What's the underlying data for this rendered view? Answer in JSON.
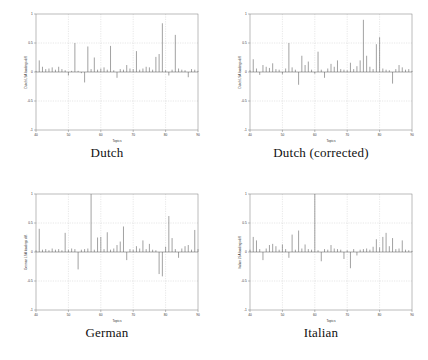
{
  "figure": {
    "background": "#ffffff",
    "panel_background": "#ffffff",
    "axis_color": "#7a7a7a",
    "grid_color": "#b9b9b9",
    "stem_color": "#555555",
    "layout": "2x2"
  },
  "panels": [
    {
      "caption": "Dutch",
      "xlabel": "Topics",
      "ylabel": "Dutch LSA loadings diff.",
      "xticks": [
        "40",
        "50",
        "60",
        "70",
        "80",
        "90"
      ],
      "yticks": [
        "1",
        "0.5",
        "0",
        "-0.5",
        "-1"
      ]
    },
    {
      "caption": "Dutch (corrected)",
      "xlabel": "Topics",
      "ylabel": "Dutch LSA loadings diff.",
      "xticks": [
        "40",
        "50",
        "60",
        "70",
        "80",
        "90"
      ],
      "yticks": [
        "1",
        "0.5",
        "0",
        "-0.5",
        "-1"
      ]
    },
    {
      "caption": "German",
      "xlabel": "Topics",
      "ylabel": "German LSA loadings diff.",
      "xticks": [
        "40",
        "50",
        "60",
        "70",
        "80",
        "90"
      ],
      "yticks": [
        "1",
        "0.5",
        "0",
        "-0.5",
        "-1"
      ]
    },
    {
      "caption": "Italian",
      "xlabel": "Topics",
      "ylabel": "Italian LSA loadings diff.",
      "xticks": [
        "40",
        "50",
        "60",
        "70",
        "80",
        "90"
      ],
      "yticks": [
        "1",
        "0.5",
        "0",
        "-0.5",
        "-1"
      ]
    }
  ],
  "chart_data": [
    {
      "type": "bar",
      "title": "Dutch",
      "xlabel": "Topics",
      "ylabel": "Dutch LSA loadings diff.",
      "xlim": [
        40,
        90
      ],
      "ylim": [
        -1,
        1
      ],
      "xticks": [
        40,
        50,
        60,
        70,
        80,
        90
      ],
      "yticks": [
        -1,
        -0.5,
        0,
        0.5,
        1
      ],
      "grid": true,
      "legend": "none",
      "x": [
        40,
        41,
        42,
        43,
        44,
        45,
        46,
        47,
        48,
        49,
        50,
        51,
        52,
        53,
        54,
        55,
        56,
        57,
        58,
        59,
        60,
        61,
        62,
        63,
        64,
        65,
        66,
        67,
        68,
        69,
        70,
        71,
        72,
        73,
        74,
        75,
        76,
        77,
        78,
        79,
        80,
        81,
        82,
        83,
        84,
        85,
        86,
        87,
        88,
        89,
        90
      ],
      "values": [
        0.02,
        0.2,
        0.09,
        0.05,
        0.06,
        0.08,
        0.04,
        0.09,
        0.05,
        0.03,
        -0.06,
        0.02,
        0.5,
        0.02,
        -0.02,
        -0.18,
        0.44,
        0.05,
        0.25,
        0.04,
        0.06,
        0.08,
        0.04,
        0.45,
        0.03,
        -0.1,
        0.05,
        0.04,
        0.12,
        0.06,
        0.05,
        0.36,
        0.04,
        0.06,
        0.09,
        0.08,
        0.04,
        0.26,
        0.31,
        0.84,
        0.03,
        -0.06,
        0.04,
        0.64,
        0.06,
        0.04,
        0.03,
        -0.09,
        0.05,
        0.04,
        0.02
      ]
    },
    {
      "type": "bar",
      "title": "Dutch (corrected)",
      "xlabel": "Topics",
      "ylabel": "Dutch LSA loadings diff.",
      "xlim": [
        40,
        90
      ],
      "ylim": [
        -1,
        1
      ],
      "xticks": [
        40,
        50,
        60,
        70,
        80,
        90
      ],
      "yticks": [
        -1,
        -0.5,
        0,
        0.5,
        1
      ],
      "grid": true,
      "legend": "none",
      "x": [
        40,
        41,
        42,
        43,
        44,
        45,
        46,
        47,
        48,
        49,
        50,
        51,
        52,
        53,
        54,
        55,
        56,
        57,
        58,
        59,
        60,
        61,
        62,
        63,
        64,
        65,
        66,
        67,
        68,
        69,
        70,
        71,
        72,
        73,
        74,
        75,
        76,
        77,
        78,
        79,
        80,
        81,
        82,
        83,
        84,
        85,
        86,
        87,
        88,
        89,
        90
      ],
      "values": [
        0.03,
        0.22,
        0.06,
        -0.05,
        0.12,
        0.09,
        0.07,
        0.15,
        0.05,
        0.04,
        -0.04,
        0.06,
        0.5,
        0.08,
        0.04,
        -0.22,
        0.28,
        0.12,
        0.18,
        0.04,
        -0.03,
        0.35,
        0.04,
        -0.1,
        0.06,
        0.14,
        0.09,
        0.2,
        0.05,
        0.04,
        0.03,
        0.16,
        0.05,
        0.1,
        0.2,
        0.9,
        0.28,
        0.09,
        0.05,
        0.48,
        0.6,
        0.06,
        0.04,
        0.03,
        -0.2,
        0.05,
        0.12,
        0.08,
        0.04,
        0.05,
        0.02
      ]
    },
    {
      "type": "bar",
      "title": "German",
      "xlabel": "Topics",
      "ylabel": "German LSA loadings diff.",
      "xlim": [
        40,
        90
      ],
      "ylim": [
        -1,
        1
      ],
      "xticks": [
        40,
        50,
        60,
        70,
        80,
        90
      ],
      "yticks": [
        -1,
        -0.5,
        0,
        0.5,
        1
      ],
      "grid": true,
      "legend": "none",
      "x": [
        40,
        41,
        42,
        43,
        44,
        45,
        46,
        47,
        48,
        49,
        50,
        51,
        52,
        53,
        54,
        55,
        56,
        57,
        58,
        59,
        60,
        61,
        62,
        63,
        64,
        65,
        66,
        67,
        68,
        69,
        70,
        71,
        72,
        73,
        74,
        75,
        76,
        77,
        78,
        79,
        80,
        81,
        82,
        83,
        84,
        85,
        86,
        87,
        88,
        89,
        90
      ],
      "values": [
        0.03,
        0.4,
        0.04,
        0.05,
        0.03,
        0.06,
        0.04,
        0.05,
        0.03,
        0.33,
        0.04,
        0.06,
        0.05,
        -0.3,
        0.04,
        0.05,
        0.06,
        1.0,
        0.04,
        0.25,
        0.26,
        0.05,
        0.34,
        0.04,
        0.06,
        0.12,
        0.18,
        0.44,
        -0.14,
        0.05,
        0.04,
        0.1,
        0.06,
        0.2,
        0.05,
        0.14,
        0.04,
        0.03,
        -0.38,
        -0.42,
        0.09,
        0.62,
        0.24,
        0.05,
        -0.1,
        0.06,
        0.1,
        0.12,
        0.04,
        0.38,
        0.05
      ]
    },
    {
      "type": "bar",
      "title": "Italian",
      "xlabel": "Topics",
      "ylabel": "Italian LSA loadings diff.",
      "xlim": [
        40,
        90
      ],
      "ylim": [
        -1,
        1
      ],
      "xticks": [
        40,
        50,
        60,
        70,
        80,
        90
      ],
      "yticks": [
        -1,
        -0.5,
        0,
        0.5,
        1
      ],
      "grid": true,
      "legend": "none",
      "x": [
        40,
        41,
        42,
        43,
        44,
        45,
        46,
        47,
        48,
        49,
        50,
        51,
        52,
        53,
        54,
        55,
        56,
        57,
        58,
        59,
        60,
        61,
        62,
        63,
        64,
        65,
        66,
        67,
        68,
        69,
        70,
        71,
        72,
        73,
        74,
        75,
        76,
        77,
        78,
        79,
        80,
        81,
        82,
        83,
        84,
        85,
        86,
        87,
        88,
        89,
        90
      ],
      "values": [
        0.04,
        0.26,
        0.2,
        0.05,
        -0.14,
        0.06,
        0.12,
        0.14,
        0.1,
        0.04,
        0.13,
        0.05,
        -0.1,
        0.3,
        0.04,
        0.37,
        0.06,
        0.13,
        0.05,
        0.04,
        1.0,
        0.03,
        -0.16,
        0.05,
        0.04,
        0.12,
        0.06,
        0.05,
        0.04,
        -0.12,
        0.03,
        -0.28,
        0.05,
        -0.06,
        0.04,
        0.05,
        0.06,
        0.04,
        0.09,
        0.22,
        0.08,
        0.26,
        0.33,
        0.1,
        0.24,
        0.05,
        0.06,
        0.2,
        0.04,
        0.03,
        0.02
      ]
    }
  ]
}
